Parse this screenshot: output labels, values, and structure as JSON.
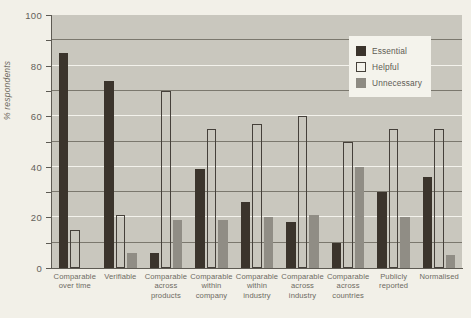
{
  "chart_data": {
    "type": "bar",
    "title": "",
    "xlabel": "",
    "ylabel": "% respondents",
    "ylim": [
      0,
      100
    ],
    "yticks": [
      0,
      20,
      40,
      60,
      80,
      100
    ],
    "ytick_labels": [
      "0",
      "20",
      "40",
      "60",
      "80",
      "100"
    ],
    "gridlines": {
      "dark_at": [
        10,
        30,
        50,
        70,
        90
      ],
      "light_at": [
        20,
        40,
        60,
        80
      ],
      "grid": true
    },
    "legend_position": "top-right",
    "categories": [
      "Comparable over time",
      "Verifiable",
      "Comparable across products",
      "Comparable within company",
      "Comparable within industry",
      "Comparable across industry",
      "Comparable across countries",
      "Publicly reported",
      "Normalised"
    ],
    "category_lines": [
      [
        "Comparable",
        "over time"
      ],
      [
        "Verifiable"
      ],
      [
        "Comparable",
        "across",
        "products"
      ],
      [
        "Comparable",
        "within",
        "company"
      ],
      [
        "Comparable",
        "within",
        "industry"
      ],
      [
        "Comparable",
        "across",
        "industry"
      ],
      [
        "Comparable",
        "across",
        "countries"
      ],
      [
        "Publicly",
        "reported"
      ],
      [
        "Normalised"
      ]
    ],
    "series": [
      {
        "name": "Essential",
        "color": "#3b342c",
        "values": [
          85,
          74,
          6,
          39,
          26,
          18,
          10,
          30,
          36
        ]
      },
      {
        "name": "Helpful",
        "color": "#ffffff",
        "values": [
          15,
          21,
          70,
          55,
          57,
          60,
          50,
          55,
          55
        ]
      },
      {
        "name": "Unnecessary",
        "color": "#908d85",
        "values": [
          0,
          6,
          19,
          19,
          20,
          21,
          40,
          20,
          5
        ]
      }
    ]
  },
  "legend": {
    "items": [
      {
        "label": "Essential"
      },
      {
        "label": "Helpful"
      },
      {
        "label": "Unnecessary"
      }
    ]
  }
}
